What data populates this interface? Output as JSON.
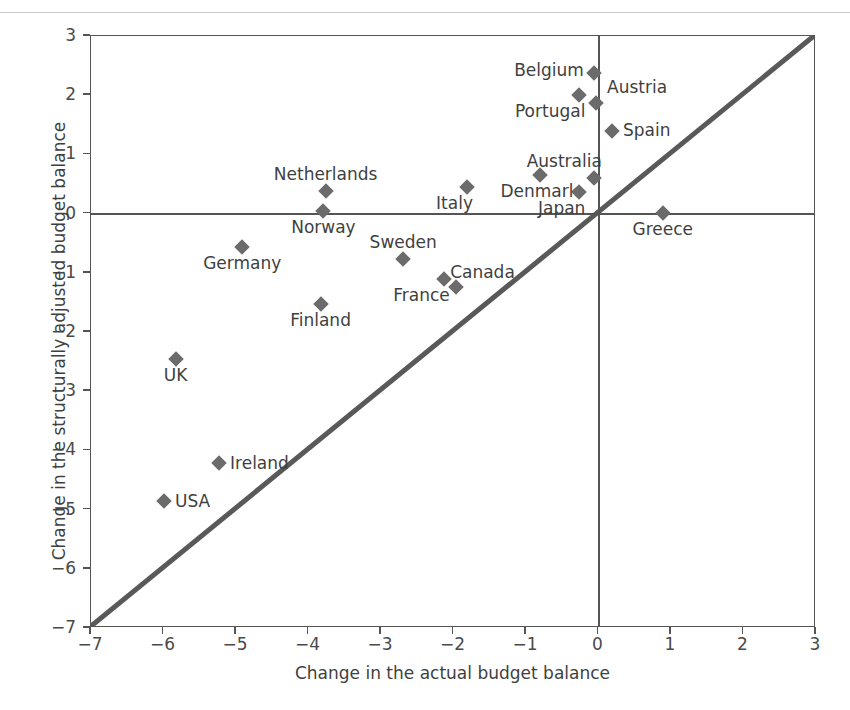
{
  "chart_data": {
    "type": "scatter",
    "title": "",
    "xlabel": "Change in the actual budget balance",
    "ylabel": "Change in the structurally adjusted budget balance",
    "xlim": [
      -7,
      3
    ],
    "ylim": [
      -7,
      3
    ],
    "xticks": [
      "−7",
      "−6",
      "−5",
      "−4",
      "−3",
      "−2",
      "−1",
      "0",
      "1",
      "2",
      "3"
    ],
    "yticks": [
      "3",
      "2",
      "1",
      "0",
      "−1",
      "−2",
      "−3",
      "−4",
      "−5",
      "−6",
      "−7"
    ],
    "grid": false,
    "legend": "none",
    "reference_line": {
      "name": "45-degree line",
      "from": [
        -7,
        -7
      ],
      "to": [
        3,
        3
      ]
    },
    "marker_color": "#6b6b6b",
    "axis_color": "#555555",
    "points": [
      {
        "label": "Belgium",
        "x": -0.05,
        "y": 2.35,
        "label_pos": "left"
      },
      {
        "label": "Austria",
        "x": -0.02,
        "y": 1.85,
        "label_pos": "right-up"
      },
      {
        "label": "Portugal",
        "x": -0.25,
        "y": 1.98,
        "label_pos": "below-left"
      },
      {
        "label": "Spain",
        "x": 0.2,
        "y": 1.38,
        "label_pos": "right"
      },
      {
        "label": "Australia",
        "x": -0.05,
        "y": 0.58,
        "label_pos": "above-left"
      },
      {
        "label": "Denmark",
        "x": -0.8,
        "y": 0.63,
        "label_pos": "below"
      },
      {
        "label": "Italy",
        "x": -1.8,
        "y": 0.43,
        "label_pos": "below-left"
      },
      {
        "label": "Japan",
        "x": -0.25,
        "y": 0.35,
        "label_pos": "below-left"
      },
      {
        "label": "Netherlands",
        "x": -3.75,
        "y": 0.37,
        "label_pos": "above"
      },
      {
        "label": "Norway",
        "x": -3.78,
        "y": 0.03,
        "label_pos": "below"
      },
      {
        "label": "Greece",
        "x": 0.9,
        "y": 0.0,
        "label_pos": "below"
      },
      {
        "label": "Germany",
        "x": -4.9,
        "y": -0.58,
        "label_pos": "below"
      },
      {
        "label": "Sweden",
        "x": -2.68,
        "y": -0.78,
        "label_pos": "above"
      },
      {
        "label": "France",
        "x": -2.12,
        "y": -1.13,
        "label_pos": "below-left"
      },
      {
        "label": "Canada",
        "x": -1.95,
        "y": -1.25,
        "label_pos": "above-right"
      },
      {
        "label": "Finland",
        "x": -3.82,
        "y": -1.55,
        "label_pos": "below"
      },
      {
        "label": "UK",
        "x": -5.82,
        "y": -2.48,
        "label_pos": "below"
      },
      {
        "label": "Ireland",
        "x": -5.22,
        "y": -4.23,
        "label_pos": "right"
      },
      {
        "label": "USA",
        "x": -5.98,
        "y": -4.88,
        "label_pos": "right"
      }
    ]
  }
}
